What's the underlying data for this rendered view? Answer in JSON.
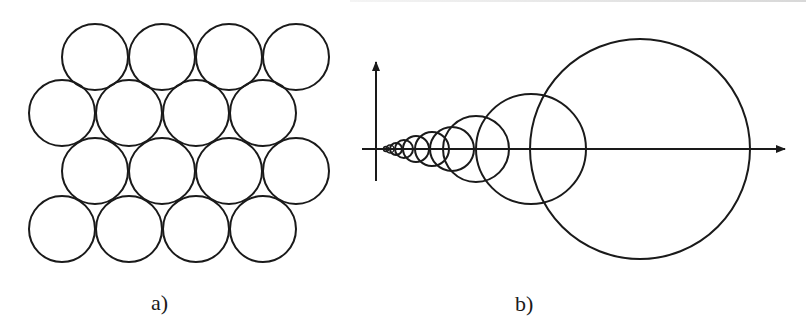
{
  "figure": {
    "panel_a": {
      "label": "a)",
      "description": "Hexagonal close packing of equal circles",
      "radius": 33,
      "rows": [
        {
          "y": 57,
          "x": [
            95,
            162,
            229,
            296
          ]
        },
        {
          "y": 113,
          "x": [
            62,
            129,
            196,
            263
          ]
        },
        {
          "y": 171,
          "x": [
            95,
            162,
            229,
            296
          ]
        },
        {
          "y": 229,
          "x": [
            62,
            129,
            196,
            263
          ]
        }
      ]
    },
    "panel_b": {
      "label": "b)",
      "description": "Sequence of circles with geometrically increasing radii centered on the horizontal axis",
      "axis": {
        "origin_x": 376,
        "origin_y": 149,
        "x_start": 362,
        "x_end": 785,
        "y_top": 62,
        "y_bottom": 181
      },
      "circles": [
        {
          "cx": 386,
          "r": 2.5
        },
        {
          "cx": 390,
          "r": 4
        },
        {
          "cx": 396,
          "r": 6
        },
        {
          "cx": 404,
          "r": 9
        },
        {
          "cx": 416,
          "r": 13
        },
        {
          "cx": 432,
          "r": 17
        },
        {
          "cx": 452,
          "r": 22
        },
        {
          "cx": 476,
          "r": 33
        },
        {
          "cx": 531,
          "r": 55
        },
        {
          "cx": 640,
          "r": 110
        }
      ]
    },
    "stroke_color": "#1a1a1a"
  }
}
